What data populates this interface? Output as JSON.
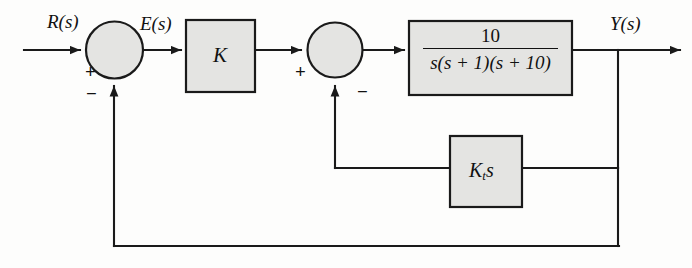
{
  "diagram": {
    "signals": {
      "input_label": "R(s)",
      "error_label": "E(s)",
      "output_label": "Y(s)"
    },
    "blocks": {
      "gain": {
        "label": "K",
        "name": "gain-block"
      },
      "plant": {
        "numerator": "10",
        "denominator_s": "s",
        "denominator_p1": "(s + 1)",
        "denominator_p2": "(s + 10)",
        "denominator_full": "s(s + 1)(s + 10)",
        "expression": "10 / (s(s + 1)(s + 10))",
        "name": "plant-block"
      },
      "rate_feedback": {
        "label_k": "K",
        "label_sub": "t",
        "label_s": "s",
        "expression": "K_t s",
        "name": "rate-feedback-block"
      }
    },
    "summers": {
      "first": {
        "name": "summing-junction-1",
        "input_sign": "+",
        "feedback_sign": "−"
      },
      "second": {
        "name": "summing-junction-2",
        "input_sign": "+",
        "feedback_sign": "−"
      }
    },
    "colors": {
      "block_fill": "#e4e4e2",
      "block_stroke": "#1a1a1a",
      "line": "#1a1a1a",
      "page_background": "#fdfdfc",
      "text": "#111111"
    }
  }
}
